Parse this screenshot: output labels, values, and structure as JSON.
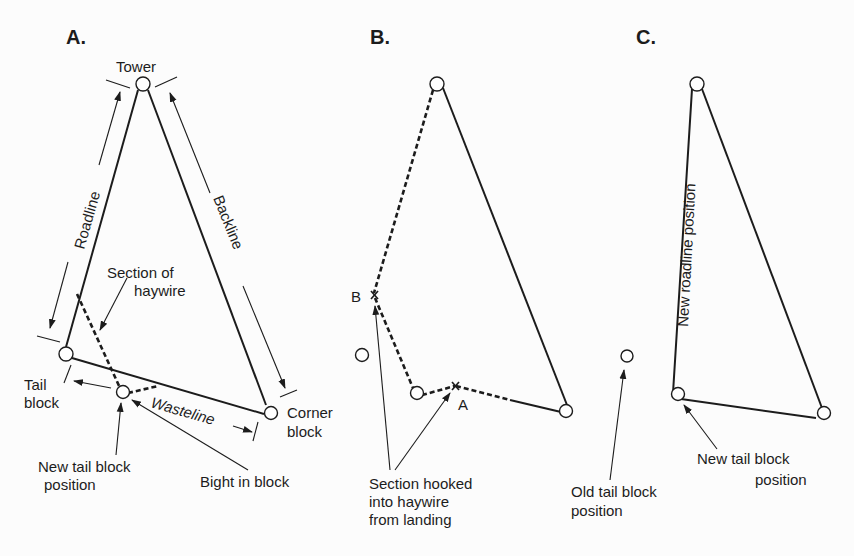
{
  "panels": {
    "A": {
      "heading": "A.",
      "labels": {
        "tower": "Tower",
        "roadline": "Roadline",
        "backline": "Backline",
        "section_of": "Section of",
        "haywire": "haywire",
        "tail": "Tail",
        "block": "block",
        "wasteline": "Wasteline",
        "corner": "Corner",
        "corner_block": "block",
        "new_tail_1": "New tail block",
        "new_tail_2": "position",
        "bight": "Bight in block"
      }
    },
    "B": {
      "heading": "B.",
      "labels": {
        "point_b": "B",
        "point_a": "A",
        "section_1": "Section hooked",
        "section_2": "into haywire",
        "section_3": "from landing"
      }
    },
    "C": {
      "heading": "C.",
      "labels": {
        "new_roadline": "New roadline position",
        "old_tail_1": "Old tail block",
        "old_tail_2": "position",
        "new_tail_1": "New tail block",
        "new_tail_2": "position"
      }
    }
  },
  "colors": {
    "ink": "#1c1c1c",
    "background": "#fcfcfc"
  }
}
